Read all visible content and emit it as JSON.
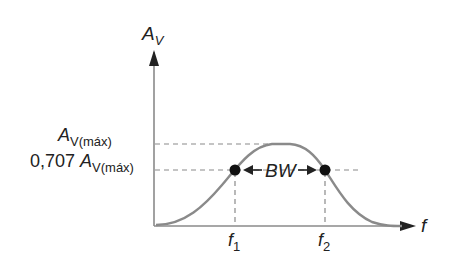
{
  "diagram": {
    "y_axis": {
      "label": "A",
      "label_sub": "V"
    },
    "x_axis": {
      "label": "f"
    },
    "levels": [
      {
        "name": "max",
        "label_main": "A",
        "label_sub": "V(máx)"
      },
      {
        "name": "half_power",
        "label_prefix": "0,707 ",
        "label_main": "A",
        "label_sub": "V(máx)"
      }
    ],
    "markers": [
      {
        "label": "f",
        "sub": "1"
      },
      {
        "label": "f",
        "sub": "2"
      }
    ],
    "bandwidth_label": "BW",
    "colors": {
      "curve": "#8a8a8a",
      "axis": "#8a8a8a",
      "dash": "#8a8a8a",
      "dot": "#111111",
      "text": "#222222"
    }
  }
}
